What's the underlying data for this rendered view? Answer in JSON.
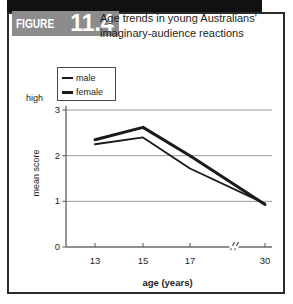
{
  "figure": {
    "badge_word": "FIGURE",
    "badge_number": "11.4",
    "title": "Age trends in young Australians' imaginary-audience reactions"
  },
  "legend": {
    "items": [
      {
        "label": "male",
        "style": "thin"
      },
      {
        "label": "female",
        "style": "thick"
      }
    ]
  },
  "colors": {
    "line": "#1a1a1a",
    "grid": "#9a9a9a",
    "axis": "#6b6b6b",
    "badge_bg": "#8c8c8c",
    "topbar": "#111111",
    "frame": "#2b2b2b"
  },
  "chart_data": {
    "type": "line",
    "title": "Age trends in young Australians' imaginary-audience reactions",
    "xlabel": "age (years)",
    "ylabel": "mean score",
    "x": [
      13,
      15,
      17,
      30
    ],
    "xtick_labels": [
      "13",
      "15",
      "17",
      "30"
    ],
    "ytick_labels": [
      "0",
      "1",
      "2",
      "3"
    ],
    "ylim": [
      0,
      3
    ],
    "y_high_annotation": "high",
    "axis_break_between": [
      17,
      30
    ],
    "grid": true,
    "legend_position": "top-left",
    "series": [
      {
        "name": "male",
        "values": [
          2.25,
          2.4,
          1.72,
          0.95
        ]
      },
      {
        "name": "female",
        "values": [
          2.35,
          2.62,
          2.0,
          0.93
        ]
      }
    ]
  }
}
